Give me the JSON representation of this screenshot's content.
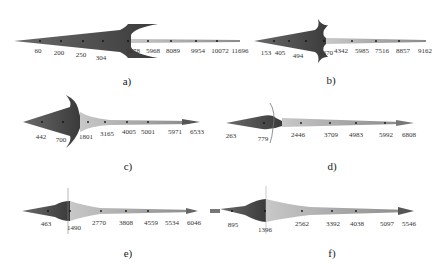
{
  "figure": {
    "panels": [
      {
        "id": "a",
        "caption": "a)",
        "labels": [
          {
            "text": "60",
            "x": 38,
            "y": 47
          },
          {
            "text": "200",
            "x": 59,
            "y": 49
          },
          {
            "text": "250",
            "x": 81,
            "y": 51
          },
          {
            "text": "304",
            "x": 101,
            "y": 54
          },
          {
            "text": "5678",
            "x": 133,
            "y": 47
          },
          {
            "text": "5968",
            "x": 153,
            "y": 47
          },
          {
            "text": "8089",
            "x": 173,
            "y": 47
          },
          {
            "text": "9954",
            "x": 198,
            "y": 47
          },
          {
            "text": "10072",
            "x": 220,
            "y": 47
          },
          {
            "text": "11696",
            "x": 240,
            "y": 47
          }
        ],
        "caption_pos": {
          "x": 127,
          "y": 75
        }
      },
      {
        "id": "b",
        "caption": "b)",
        "labels": [
          {
            "text": "153",
            "x": 266,
            "y": 49
          },
          {
            "text": "405",
            "x": 280,
            "y": 49
          },
          {
            "text": "494",
            "x": 298,
            "y": 52
          },
          {
            "text": "1370",
            "x": 326,
            "y": 49
          },
          {
            "text": "4342",
            "x": 341,
            "y": 47
          },
          {
            "text": "5985",
            "x": 362,
            "y": 47
          },
          {
            "text": "7516",
            "x": 382,
            "y": 47
          },
          {
            "text": "8857",
            "x": 403,
            "y": 47
          },
          {
            "text": "9162",
            "x": 425,
            "y": 47
          }
        ],
        "caption_pos": {
          "x": 331,
          "y": 74
        }
      },
      {
        "id": "c",
        "caption": "c)",
        "labels": [
          {
            "text": "442",
            "x": 41,
            "y": 133
          },
          {
            "text": "700",
            "x": 61,
            "y": 136
          },
          {
            "text": "1801",
            "x": 86,
            "y": 133
          },
          {
            "text": "3165",
            "x": 107,
            "y": 130
          },
          {
            "text": "4005",
            "x": 129,
            "y": 128
          },
          {
            "text": "5001",
            "x": 148,
            "y": 128
          },
          {
            "text": "5971",
            "x": 175,
            "y": 128
          },
          {
            "text": "6533",
            "x": 197,
            "y": 128
          }
        ],
        "caption_pos": {
          "x": 128,
          "y": 160
        }
      },
      {
        "id": "d",
        "caption": "d)",
        "labels": [
          {
            "text": "263",
            "x": 231,
            "y": 132
          },
          {
            "text": "779",
            "x": 263,
            "y": 135
          },
          {
            "text": "2446",
            "x": 298,
            "y": 131
          },
          {
            "text": "3709",
            "x": 331,
            "y": 131
          },
          {
            "text": "4983",
            "x": 356,
            "y": 131
          },
          {
            "text": "5992",
            "x": 386,
            "y": 131
          },
          {
            "text": "6808",
            "x": 409,
            "y": 131
          }
        ],
        "caption_pos": {
          "x": 332,
          "y": 160
        }
      },
      {
        "id": "e",
        "caption": "e)",
        "labels": [
          {
            "text": "463",
            "x": 46,
            "y": 220
          },
          {
            "text": "1490",
            "x": 74,
            "y": 224
          },
          {
            "text": "2770",
            "x": 99,
            "y": 219
          },
          {
            "text": "3808",
            "x": 126,
            "y": 219
          },
          {
            "text": "4559",
            "x": 151,
            "y": 219
          },
          {
            "text": "5534",
            "x": 172,
            "y": 219
          },
          {
            "text": "6046",
            "x": 194,
            "y": 219
          }
        ],
        "caption_pos": {
          "x": 128,
          "y": 247
        }
      },
      {
        "id": "f",
        "caption": "f)",
        "labels": [
          {
            "text": "895",
            "x": 233,
            "y": 221
          },
          {
            "text": "1396",
            "x": 265,
            "y": 226
          },
          {
            "text": "2562",
            "x": 302,
            "y": 220
          },
          {
            "text": "3392",
            "x": 333,
            "y": 220
          },
          {
            "text": "4038",
            "x": 357,
            "y": 220
          },
          {
            "text": "5097",
            "x": 387,
            "y": 220
          },
          {
            "text": "5546",
            "x": 409,
            "y": 220
          }
        ],
        "caption_pos": {
          "x": 332,
          "y": 247
        }
      }
    ],
    "colors": {
      "dark_region": "#4a4a4a",
      "light_region": "#bdbdbd",
      "line": "#555555",
      "dot": "#111111"
    }
  }
}
